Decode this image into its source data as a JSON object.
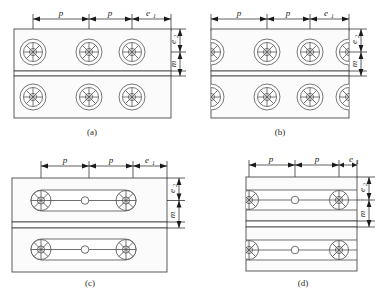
{
  "figure": {
    "type": "engineering-drawing",
    "panels": [
      {
        "id": "a",
        "caption": "(a)",
        "hole_style": "circular-spoked",
        "hole_clipped_at_edge": false,
        "rows": 2,
        "holes_per_row": 3,
        "dimensions": {
          "horizontal": [
            "p",
            "p",
            "e1"
          ],
          "vertical": [
            "e2",
            "m"
          ]
        }
      },
      {
        "id": "b",
        "caption": "(b)",
        "hole_style": "circular-spoked",
        "hole_clipped_at_edge": true,
        "rows": 2,
        "holes_per_row": 3,
        "dimensions": {
          "horizontal": [
            "p",
            "p",
            "e1"
          ],
          "vertical": [
            "e2",
            "m"
          ]
        }
      },
      {
        "id": "c",
        "caption": "(c)",
        "hole_style": "obround-slot",
        "hole_clipped_at_edge": false,
        "rows": 2,
        "holes_per_row": 3,
        "dimensions": {
          "horizontal": [
            "p",
            "p",
            "e1"
          ],
          "vertical": [
            "e2",
            "m"
          ]
        }
      },
      {
        "id": "d",
        "caption": "(d)",
        "hole_style": "rectangular-slot",
        "hole_clipped_at_edge": true,
        "rows": 2,
        "holes_per_row": 3,
        "dimensions": {
          "horizontal": [
            "p",
            "p",
            "e1"
          ],
          "vertical": [
            "e2",
            "m"
          ]
        }
      }
    ],
    "labels": {
      "pitch": "p",
      "edge_distance_horizontal_base": "e",
      "edge_distance_horizontal_sub": "1",
      "edge_distance_vertical_base": "e",
      "edge_distance_vertical_sub": "2",
      "seam_gap": "m"
    },
    "colors": {
      "outline": "#4a4a4a",
      "hatch": "#9a9a9a",
      "dimension": "#1a1a1a",
      "background": "#ffffff"
    }
  }
}
